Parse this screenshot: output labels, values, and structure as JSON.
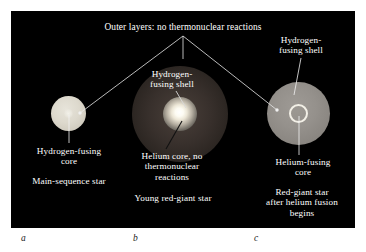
{
  "figure": {
    "background_color": "#ffffff",
    "panel_color": "#000000",
    "text_color": "#ffffff",
    "letter_color": "#1a1a1a"
  },
  "top_caption": "Outer layers: no thermonuclear reactions",
  "panels": [
    {
      "letter": "a",
      "caption": "Main-sequence star",
      "star_name": "main-sequence-star",
      "star_color": "#ddd9cd",
      "labels": {
        "core": "Hydrogen-fusing\ncore"
      }
    },
    {
      "letter": "b",
      "caption": "Young red-giant star",
      "star_name": "young-red-giant-star",
      "star_color": "#38302c",
      "core_color": "#fdfbf2",
      "labels": {
        "shell": "Hydrogen-\nfusing shell",
        "core": "Helium core, no\nthermonuclear\nreactions"
      }
    },
    {
      "letter": "c",
      "caption": "Red-giant star\nafter helium fusion\nbegins",
      "star_name": "red-giant-star-helium-fusion",
      "star_color": "#95918c",
      "ring_color": "#f2efe6",
      "labels": {
        "shell": "Hydrogen-\nfusing shell",
        "core": "Helium-fusing\ncore"
      }
    }
  ],
  "leader_lines": {
    "apex_label": "outer-layers-leader-apex",
    "targets": [
      "main-sequence-star",
      "young-red-giant-star",
      "red-giant-star-helium-fusion"
    ]
  }
}
